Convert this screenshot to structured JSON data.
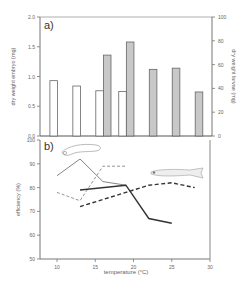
{
  "chart_data": [
    {
      "panel_label": "a)",
      "type": "bar",
      "xlabel": "",
      "ylabel_left": "dry weight embryo (mg)",
      "ylabel_right": "dry weight larvae (mg)",
      "ylim_left": [
        0,
        2.0
      ],
      "ylim_right": [
        0,
        100
      ],
      "yticks_left": [
        "0.0",
        "0.5",
        "1.0",
        "1.5",
        "2.0"
      ],
      "yticks_right": [
        "0",
        "20",
        "40",
        "60",
        "80",
        "100"
      ],
      "series": [
        {
          "name": "embryo",
          "axis": "left",
          "color": "#ffffff",
          "x": [
            10,
            13,
            16,
            19
          ],
          "values": [
            0.93,
            0.84,
            0.76,
            0.75
          ]
        },
        {
          "name": "larvae",
          "axis": "right",
          "color": "#c8c8c8",
          "x": [
            16,
            19,
            22,
            25,
            28
          ],
          "values": [
            68,
            79,
            56,
            57,
            37
          ]
        }
      ]
    },
    {
      "panel_label": "b)",
      "type": "line",
      "xlabel": "temperature (°C)",
      "ylabel": "efficiency (%)",
      "xlim": [
        8,
        30
      ],
      "ylim": [
        50,
        100
      ],
      "xticks": [
        "10",
        "15",
        "20",
        "25",
        "30"
      ],
      "yticks": [
        "50",
        "60",
        "70",
        "80",
        "90",
        "100"
      ],
      "series": [
        {
          "name": "embryo solid",
          "style": "thin-solid",
          "x": [
            10,
            13,
            16,
            19
          ],
          "values": [
            85,
            92,
            82.5,
            81
          ]
        },
        {
          "name": "embryo dashed",
          "style": "thin-dashed",
          "x": [
            10,
            13,
            16,
            19
          ],
          "values": [
            78,
            74.5,
            89,
            89
          ]
        },
        {
          "name": "larvae solid",
          "style": "thick-solid",
          "x": [
            13,
            19,
            22,
            25
          ],
          "values": [
            79,
            81,
            67,
            65
          ]
        },
        {
          "name": "larvae dashed",
          "style": "thick-dashed",
          "x": [
            13,
            16,
            19,
            22,
            25,
            28
          ],
          "values": [
            72,
            75,
            78,
            81,
            82,
            80
          ]
        }
      ],
      "annotations": [
        "embryo illustration (top-left)",
        "larva illustration (right)"
      ]
    }
  ]
}
